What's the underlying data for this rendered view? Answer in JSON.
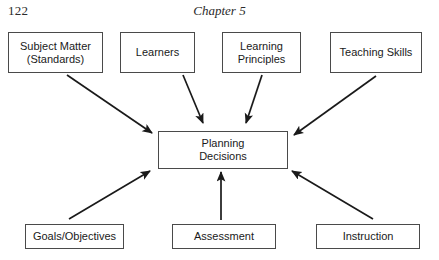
{
  "header": {
    "page_number": "122",
    "chapter_title": "Chapter 5"
  },
  "diagram": {
    "line_color": "#1a1a1a",
    "box_border_color": "#4a4a4a",
    "background_color": "#ffffff",
    "center_node": {
      "id": "planning-decisions",
      "label": "Planning\nDecisions"
    },
    "top_nodes": [
      {
        "id": "subject-matter",
        "label": "Subject Matter\n(Standards)"
      },
      {
        "id": "learners",
        "label": "Learners"
      },
      {
        "id": "learning-principles",
        "label": "Learning\nPrinciples"
      },
      {
        "id": "teaching-skills",
        "label": "Teaching Skills"
      }
    ],
    "bottom_nodes": [
      {
        "id": "goals-objectives",
        "label": "Goals/Objectives"
      },
      {
        "id": "assessment",
        "label": "Assessment"
      },
      {
        "id": "instruction",
        "label": "Instruction"
      }
    ],
    "arrows": [
      {
        "from": "subject-matter",
        "to": "planning-decisions",
        "direction": "down-right"
      },
      {
        "from": "learners",
        "to": "planning-decisions",
        "direction": "down-right"
      },
      {
        "from": "learning-principles",
        "to": "planning-decisions",
        "direction": "down-left"
      },
      {
        "from": "teaching-skills",
        "to": "planning-decisions",
        "direction": "down-left"
      },
      {
        "from": "goals-objectives",
        "to": "planning-decisions",
        "direction": "up-right"
      },
      {
        "from": "assessment",
        "to": "planning-decisions",
        "direction": "up"
      },
      {
        "from": "instruction",
        "to": "planning-decisions",
        "direction": "up-left"
      }
    ]
  }
}
